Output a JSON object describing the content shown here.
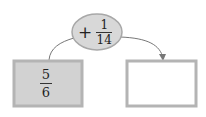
{
  "operation": {
    "operator": "+",
    "numerator": "1",
    "denominator": "14"
  },
  "start_box": {
    "numerator": "5",
    "denominator": "6"
  },
  "result_box": {
    "value": ""
  },
  "colors": {
    "ellipse_fill": "#d8d8d8",
    "ellipse_stroke": "#a8a8a8",
    "box_fill": "#d2d2d2",
    "box_border": "#b4b4b4",
    "arrow": "#777777"
  }
}
